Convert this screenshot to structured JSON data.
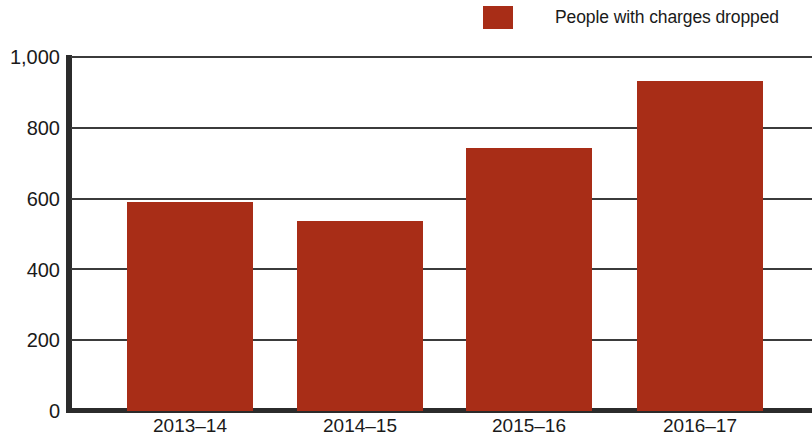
{
  "chart_data": {
    "type": "bar",
    "title": "",
    "subtitle": "",
    "xlabel": "",
    "ylabel": "",
    "categories": [
      "2013–14",
      "2014–15",
      "2015–16",
      "2016–17"
    ],
    "series": [
      {
        "name": "People with charges dropped",
        "color": "#a82d17",
        "values": [
          590,
          535,
          740,
          930
        ]
      }
    ],
    "ylim": [
      0,
      1000
    ],
    "ytick_values": [
      0,
      200,
      400,
      600,
      800,
      1000
    ],
    "ytick_labels": [
      "0",
      "200",
      "400",
      "600",
      "800",
      "1,000"
    ],
    "grid": true,
    "grid_axis": "y",
    "legend": {
      "position": "top-right",
      "entries": [
        {
          "label": "People with charges dropped",
          "color": "#a82d17",
          "swatch": "legend-swatch"
        }
      ]
    },
    "axis_color": "#2b2b2b",
    "gridline_color": "#3b3b3b",
    "background": "#ffffff"
  }
}
